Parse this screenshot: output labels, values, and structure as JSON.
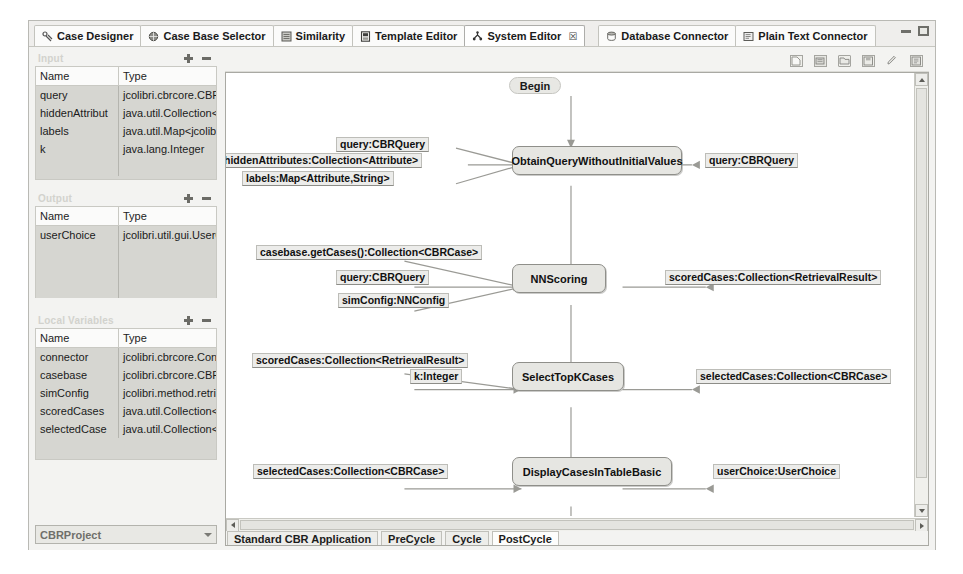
{
  "window": {
    "minimize_label": "minimize",
    "maximize_label": "maximize"
  },
  "tabs": [
    {
      "label": "Case Designer",
      "icon": "case-designer-icon",
      "active": false,
      "group": 1
    },
    {
      "label": "Case Base Selector",
      "icon": "case-base-selector-icon",
      "active": false,
      "group": 1
    },
    {
      "label": "Similarity",
      "icon": "similarity-icon",
      "active": false,
      "group": 1
    },
    {
      "label": "Template Editor",
      "icon": "template-editor-icon",
      "active": false,
      "group": 1
    },
    {
      "label": "System Editor",
      "icon": "system-editor-icon",
      "active": true,
      "closable": true,
      "close_label": "☒",
      "group": 1
    },
    {
      "label": "Database Connector",
      "icon": "database-connector-icon",
      "active": false,
      "group": 2
    },
    {
      "label": "Plain Text Connector",
      "icon": "plain-text-connector-icon",
      "active": false,
      "group": 2
    }
  ],
  "panels": {
    "input": {
      "title": "Input",
      "add_label": "add-parameter",
      "remove_label": "remove-parameter",
      "columns": [
        "Name",
        "Type"
      ],
      "rows": [
        {
          "name": "query",
          "type": "jcolibri.cbrcore.CBRQ"
        },
        {
          "name": "hiddenAttribut",
          "type": "java.util.Collection<jc"
        },
        {
          "name": "labels",
          "type": "java.util.Map<jcolibri."
        },
        {
          "name": "k",
          "type": "java.lang.Integer"
        }
      ]
    },
    "output": {
      "title": "Output",
      "add_label": "add-parameter",
      "remove_label": "remove-parameter",
      "columns": [
        "Name",
        "Type"
      ],
      "rows": [
        {
          "name": "userChoice",
          "type": "jcolibri.util.gui.UserCh"
        }
      ]
    },
    "local": {
      "title": "Local Variables",
      "add_label": "add-variable",
      "remove_label": "remove-variable",
      "columns": [
        "Name",
        "Type"
      ],
      "rows": [
        {
          "name": "connector",
          "type": "jcolibri.cbrcore.Conne"
        },
        {
          "name": "casebase",
          "type": "jcolibri.cbrcore.CBRCa"
        },
        {
          "name": "simConfig",
          "type": "jcolibri.method.retrie"
        },
        {
          "name": "scoredCases",
          "type": "java.util.Collection<jc"
        },
        {
          "name": "selectedCase",
          "type": "java.util.Collection<jc"
        }
      ]
    }
  },
  "project_selector": {
    "value": "CBRProject"
  },
  "editor_toolbar": {
    "buttons": [
      {
        "name": "new-icon"
      },
      {
        "name": "import-icon"
      },
      {
        "name": "export-icon"
      },
      {
        "name": "save-icon"
      },
      {
        "name": "edit-icon"
      },
      {
        "name": "generate-icon"
      }
    ]
  },
  "bottom_tabs": [
    {
      "label": "Standard CBR Application",
      "active": false
    },
    {
      "label": "PreCycle",
      "active": false
    },
    {
      "label": "Cycle",
      "active": false
    },
    {
      "label": "PostCycle",
      "active": true
    }
  ],
  "diagram": {
    "start_label": "Begin",
    "nodes": [
      {
        "id": "n1",
        "label": "ObtainQueryWithoutInitialValues"
      },
      {
        "id": "n2",
        "label": "NNScoring"
      },
      {
        "id": "n3",
        "label": "SelectTopKCases"
      },
      {
        "id": "n4",
        "label": "DisplayCasesInTableBasic"
      }
    ],
    "inputs": {
      "n1": [
        "query:CBRQuery",
        "hiddenAttributes:Collection<Attribute>",
        "labels:Map<Attribute,String>"
      ],
      "n2": [
        "casebase.getCases():Collection<CBRCase>",
        "query:CBRQuery",
        "simConfig:NNConfig"
      ],
      "n3": [
        "scoredCases:Collection<RetrievalResult>",
        "k:Integer"
      ],
      "n4": [
        "selectedCases:Collection<CBRCase>"
      ]
    },
    "outputs": {
      "n1": [
        "query:CBRQuery"
      ],
      "n2": [
        "scoredCases:Collection<RetrievalResult>"
      ],
      "n3": [
        "selectedCases:Collection<CBRCase>"
      ],
      "n4": [
        "userChoice:UserChoice"
      ]
    }
  }
}
